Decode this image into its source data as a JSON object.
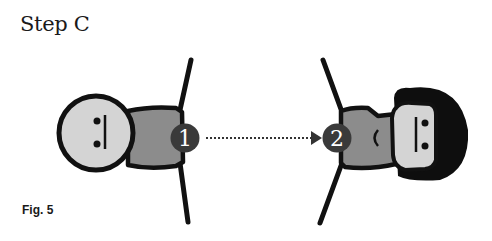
{
  "title": "Step C",
  "caption": "Fig. 5",
  "figures": [
    {
      "id": "person-1",
      "label": "1",
      "hair": false
    },
    {
      "id": "person-2",
      "label": "2",
      "hair": true
    }
  ],
  "connector": {
    "from": "1",
    "to": "2",
    "style": "dotted-arrow"
  },
  "colors": {
    "outline": "#111111",
    "face": "#d4d4d4",
    "body": "#8c8c8c",
    "badge": "#3a3a3a",
    "hair": "#0e0e0e"
  }
}
